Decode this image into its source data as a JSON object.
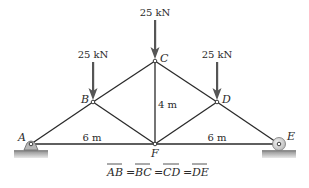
{
  "diagram": {
    "type": "truss",
    "nodes": {
      "A": {
        "label": "A",
        "x": 31,
        "y": 144
      },
      "B": {
        "label": "B",
        "x": 93,
        "y": 102
      },
      "C": {
        "label": "C",
        "x": 155,
        "y": 61
      },
      "D": {
        "label": "D",
        "x": 217,
        "y": 102
      },
      "E": {
        "label": "E",
        "x": 279,
        "y": 144
      },
      "F": {
        "label": "F",
        "x": 155,
        "y": 144
      }
    },
    "members": [
      "AB",
      "BC",
      "CD",
      "DE",
      "AF",
      "FE",
      "BF",
      "CF",
      "DF"
    ],
    "loads": [
      {
        "node": "B",
        "label": "25 kN"
      },
      {
        "node": "C",
        "label": "25 kN"
      },
      {
        "node": "D",
        "label": "25 kN"
      }
    ],
    "dimensions": {
      "left_span": "6 m",
      "right_span": "6 m",
      "height": "4 m"
    },
    "supports": {
      "A": "pin",
      "E": "roller"
    },
    "equation": {
      "terms": [
        "AB",
        "BC",
        "CD",
        "DE"
      ],
      "separator": "="
    },
    "colors": {
      "member": "#2a2a2a",
      "arrow": "#555555",
      "support_fill": "#b8b8b8",
      "ground": "#a8a8a8"
    }
  }
}
